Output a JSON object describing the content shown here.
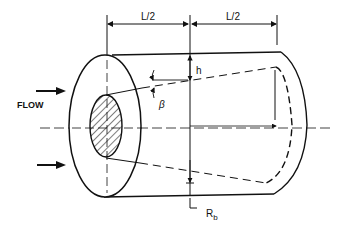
{
  "diagram": {
    "type": "engineering-schematic",
    "labels": {
      "flow": "FLOW",
      "half_length_left": "L/2",
      "half_length_right": "L/2",
      "height": "h",
      "angle": "β",
      "radius": "R",
      "radius_subscript": "b"
    },
    "colors": {
      "line": "#111111",
      "background": "#ffffff"
    }
  }
}
